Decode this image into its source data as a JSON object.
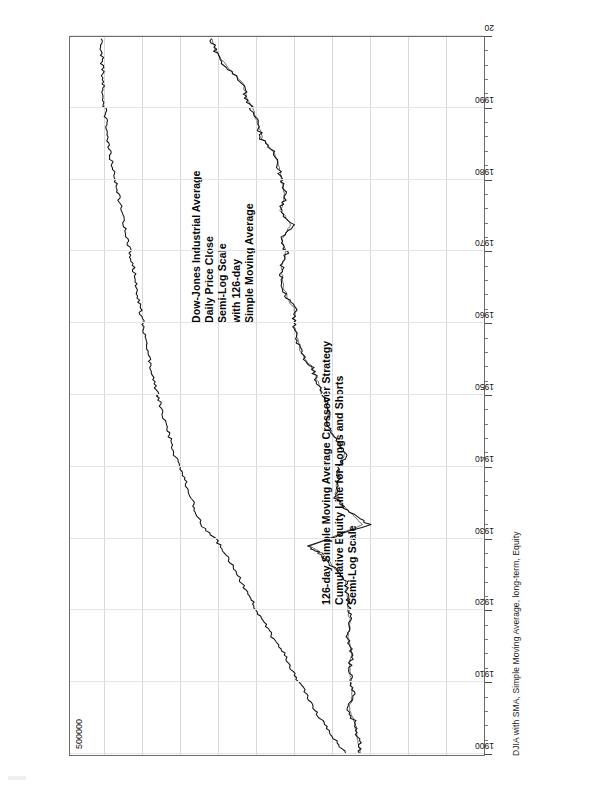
{
  "page": {
    "header_caption": "DJIA with SMA, Simple Moving Average, long-term,  Equity"
  },
  "annotations": {
    "equity": [
      "126-day Simple Moving Average Crossover Strategy",
      "Cumulative Equity Line for Longs and Shorts",
      "Semi-Log Scale"
    ],
    "djia": [
      "Dow-Jones Industrial Average",
      "Daily Price Close",
      "Semi-Log Scale",
      "with 126-day",
      "Simple Moving Average"
    ]
  },
  "chart_data": {
    "type": "line",
    "title": "DJIA with SMA, Simple Moving Average, long-term,  Equity",
    "xlabel": "",
    "ylabel": "",
    "yscale": "log",
    "ylim": [
      1,
      1000000
    ],
    "ytick_labels": [
      "500000"
    ],
    "grid": true,
    "legend": "none",
    "xlim": [
      1900,
      2000
    ],
    "xtick_labels": [
      "1900",
      "1910",
      "1920",
      "1930",
      "1940",
      "1950",
      "1960",
      "1970",
      "1980",
      "1990",
      "20"
    ],
    "xticks": [
      1900,
      1910,
      1920,
      1930,
      1940,
      1950,
      1960,
      1970,
      1980,
      1990,
      2000
    ],
    "series": [
      {
        "name": "Cumulative Equity Line for Longs and Shorts",
        "x": [
          1900,
          1902,
          1904,
          1906,
          1908,
          1910,
          1912,
          1914,
          1916,
          1918,
          1920,
          1922,
          1924,
          1926,
          1928,
          1930,
          1932,
          1934,
          1936,
          1938,
          1940,
          1942,
          1944,
          1946,
          1948,
          1950,
          1952,
          1954,
          1956,
          1958,
          1960,
          1962,
          1964,
          1966,
          1968,
          1970,
          1972,
          1974,
          1976,
          1978,
          1980,
          1982,
          1984,
          1986,
          1988,
          1990,
          1992,
          1994,
          1996,
          1998,
          2000
        ],
        "values": [
          100,
          150,
          210,
          300,
          380,
          520,
          690,
          880,
          1250,
          1700,
          2300,
          2900,
          3900,
          5000,
          6800,
          9500,
          16000,
          19000,
          23000,
          27000,
          33000,
          40000,
          46000,
          55000,
          62000,
          70000,
          80000,
          92000,
          100000,
          108000,
          118000,
          130000,
          140000,
          152000,
          168000,
          185000,
          205000,
          230000,
          255000,
          280000,
          310000,
          345000,
          375000,
          400000,
          430000,
          450000,
          468000,
          480000,
          492000,
          500000,
          510000
        ]
      },
      {
        "name": "Dow-Jones Industrial Average Daily Price Close",
        "x": [
          1900,
          1902,
          1904,
          1906,
          1908,
          1910,
          1912,
          1914,
          1916,
          1918,
          1920,
          1922,
          1924,
          1926,
          1928,
          1929,
          1932,
          1934,
          1936,
          1938,
          1940,
          1942,
          1944,
          1946,
          1948,
          1950,
          1952,
          1954,
          1956,
          1958,
          1960,
          1962,
          1964,
          1966,
          1968,
          1970,
          1972,
          1974,
          1976,
          1978,
          1980,
          1982,
          1984,
          1986,
          1988,
          1990,
          1992,
          1994,
          1996,
          1998,
          2000
        ],
        "values": [
          60,
          65,
          70,
          95,
          75,
          85,
          88,
          80,
          95,
          84,
          90,
          95,
          100,
          155,
          250,
          381,
          45,
          100,
          150,
          130,
          130,
          100,
          145,
          200,
          180,
          220,
          275,
          330,
          485,
          560,
          615,
          590,
          800,
          950,
          940,
          800,
          950,
          650,
          1000,
          820,
          950,
          1050,
          1200,
          1900,
          2150,
          2600,
          3300,
          3800,
          6500,
          9200,
          11000
        ]
      },
      {
        "name": "126-day Simple Moving Average of DJIA",
        "x": [
          1900,
          1902,
          1904,
          1906,
          1908,
          1910,
          1912,
          1914,
          1916,
          1918,
          1920,
          1922,
          1924,
          1926,
          1928,
          1929,
          1932,
          1934,
          1936,
          1938,
          1940,
          1942,
          1944,
          1946,
          1948,
          1950,
          1952,
          1954,
          1956,
          1958,
          1960,
          1962,
          1964,
          1966,
          1968,
          1970,
          1972,
          1974,
          1976,
          1978,
          1980,
          1982,
          1984,
          1986,
          1988,
          1990,
          1992,
          1994,
          1996,
          1998,
          2000
        ],
        "values": [
          62,
          66,
          72,
          90,
          80,
          86,
          88,
          83,
          93,
          86,
          92,
          96,
          102,
          150,
          235,
          350,
          55,
          95,
          145,
          135,
          128,
          105,
          140,
          195,
          185,
          215,
          270,
          325,
          475,
          550,
          605,
          600,
          790,
          935,
          935,
          810,
          940,
          680,
          980,
          840,
          940,
          1040,
          1190,
          1850,
          2120,
          2580,
          3250,
          3750,
          6300,
          9000,
          10800
        ]
      }
    ]
  }
}
